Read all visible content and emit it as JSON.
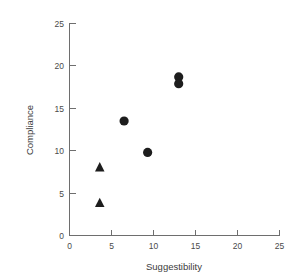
{
  "chart_data": {
    "type": "scatter",
    "title": "",
    "xlabel": "Suggestibility",
    "ylabel": "Compliance",
    "xlim": [
      0,
      25
    ],
    "ylim": [
      0,
      25
    ],
    "xticks": [
      0,
      5,
      10,
      15,
      20,
      25
    ],
    "yticks": [
      0,
      5,
      10,
      15,
      20,
      25
    ],
    "xtick_labels": [
      "0",
      "5",
      "10",
      "15",
      "20",
      "25"
    ],
    "ytick_labels": [
      "0",
      "5",
      "10",
      "15",
      "20",
      "25"
    ],
    "grid": false,
    "legend": false,
    "legend_position": "none",
    "marker_color": "#1d1d1d",
    "axis_color": "#6e6e6e",
    "background_color": "#ffffff",
    "series": [
      {
        "name": "circles",
        "marker": "circle",
        "color": "#1d1d1d",
        "points": [
          {
            "x": 6.5,
            "y": 13.5
          },
          {
            "x": 9.3,
            "y": 9.8
          },
          {
            "x": 13.0,
            "y": 18.7
          },
          {
            "x": 13.0,
            "y": 17.9
          }
        ]
      },
      {
        "name": "triangles",
        "marker": "triangle",
        "color": "#1d1d1d",
        "points": [
          {
            "x": 3.6,
            "y": 8.0
          },
          {
            "x": 3.6,
            "y": 3.8
          }
        ]
      }
    ]
  },
  "axis": {
    "x_title": "Suggestibility",
    "y_title": "Compliance"
  },
  "ticks": {
    "x": [
      "0",
      "5",
      "10",
      "15",
      "20",
      "25"
    ],
    "y": [
      "25",
      "20",
      "15",
      "10",
      "5",
      "0"
    ]
  }
}
